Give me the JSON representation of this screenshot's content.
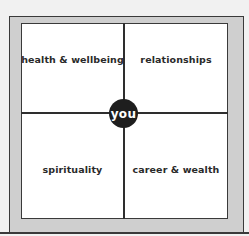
{
  "diagram": {
    "center_label": "you",
    "quadrants": [
      {
        "position": "top-left",
        "label": "health & wellbeing"
      },
      {
        "position": "top-right",
        "label": "relationships"
      },
      {
        "position": "bottom-left",
        "label": "spirituality"
      },
      {
        "position": "bottom-right",
        "label": "career & wealth"
      }
    ],
    "colors": {
      "background": "#f1f1f1",
      "frame": "#cfcfcf",
      "inner": "#ffffff",
      "lines": "#2e2e2e",
      "center_circle": "#1e1e1e",
      "center_text": "#ffffff"
    }
  }
}
